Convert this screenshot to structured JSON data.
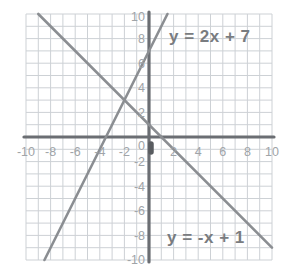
{
  "chart_data": {
    "type": "line",
    "title": "",
    "xlabel": "",
    "ylabel": "",
    "x_range": [
      -10,
      10
    ],
    "y_range": [
      -10,
      10
    ],
    "grid_step": 1,
    "grid_on": true,
    "x_ticks": [
      -10,
      -8,
      -6,
      -4,
      -2,
      2,
      4,
      6,
      8,
      10
    ],
    "y_ticks": [
      10,
      8,
      6,
      4,
      2,
      -2,
      -4,
      -6,
      -8,
      -10
    ],
    "origin_label": "0",
    "series": [
      {
        "label": "y = 2x + 7",
        "slope": 2,
        "y_intercept": 7,
        "segment": [
          [
            -8.5,
            -10
          ],
          [
            1.5,
            10
          ]
        ]
      },
      {
        "label": "y = -x + 1",
        "slope": -1,
        "y_intercept": 1,
        "segment": [
          [
            -9,
            10
          ],
          [
            10,
            -9
          ]
        ]
      }
    ],
    "colors": {
      "background": "#ffffff",
      "grid": "#cdd1d5",
      "axis": "#6b6e73",
      "line": "#8b8e92",
      "tick_label": "#a0a4a8",
      "equation_label": "#797c80",
      "origin_marker": "#595c60"
    }
  }
}
